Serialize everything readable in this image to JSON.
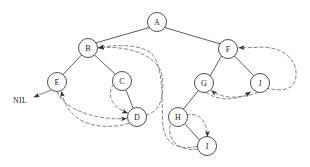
{
  "diagram": {
    "background_color": "#fefefe",
    "node_fill": "#ffffff",
    "node_stroke": "#3a3a3a",
    "edge_color": "#4a4a4a",
    "thread_color": "#6a6a6a",
    "text_color": "#1a1a1a",
    "node_radius": 9.5,
    "nil_label": "NIL"
  },
  "nodes": [
    {
      "id": "A",
      "label": "A",
      "cx": 157,
      "cy": 22
    },
    {
      "id": "B",
      "label": "B",
      "cx": 88,
      "cy": 48
    },
    {
      "id": "F",
      "label": "F",
      "cx": 228,
      "cy": 49
    },
    {
      "id": "E",
      "label": "E",
      "cx": 57,
      "cy": 82
    },
    {
      "id": "C",
      "label": "C",
      "cx": 122,
      "cy": 81
    },
    {
      "id": "G",
      "label": "G",
      "cx": 204,
      "cy": 83
    },
    {
      "id": "J",
      "label": "J",
      "cx": 260,
      "cy": 83
    },
    {
      "id": "D",
      "label": "D",
      "cx": 137,
      "cy": 117
    },
    {
      "id": "H",
      "label": "H",
      "cx": 178,
      "cy": 117
    },
    {
      "id": "I",
      "label": "I",
      "cx": 207,
      "cy": 146
    }
  ],
  "tree_edges": [
    {
      "from": "A",
      "to": "B"
    },
    {
      "from": "A",
      "to": "F"
    },
    {
      "from": "B",
      "to": "E"
    },
    {
      "from": "B",
      "to": "C"
    },
    {
      "from": "C",
      "to": "D"
    },
    {
      "from": "F",
      "to": "G"
    },
    {
      "from": "F",
      "to": "J"
    },
    {
      "from": "G",
      "to": "H"
    },
    {
      "from": "H",
      "to": "I"
    }
  ],
  "threads": [
    {
      "from": "E",
      "to": "NIL",
      "note": "predecessor thread to NIL"
    },
    {
      "from": "E",
      "to": "D",
      "note": "successor thread"
    },
    {
      "from": "D",
      "to": "E",
      "note": "predecessor thread"
    },
    {
      "from": "C",
      "to": "D",
      "note": "successor thread"
    },
    {
      "from": "D",
      "to": "B",
      "note": "successor thread"
    },
    {
      "from": "I",
      "to": "B",
      "note": "successor thread"
    },
    {
      "from": "H",
      "to": "I",
      "note": "successor thread"
    },
    {
      "from": "I",
      "to": "H",
      "note": "predecessor thread"
    },
    {
      "from": "G",
      "to": "J",
      "note": "successor thread"
    },
    {
      "from": "J",
      "to": "G",
      "note": "predecessor thread"
    },
    {
      "from": "J",
      "to": "F",
      "note": "successor thread"
    }
  ],
  "nil": {
    "label": "NIL",
    "x": 20,
    "y": 100
  }
}
